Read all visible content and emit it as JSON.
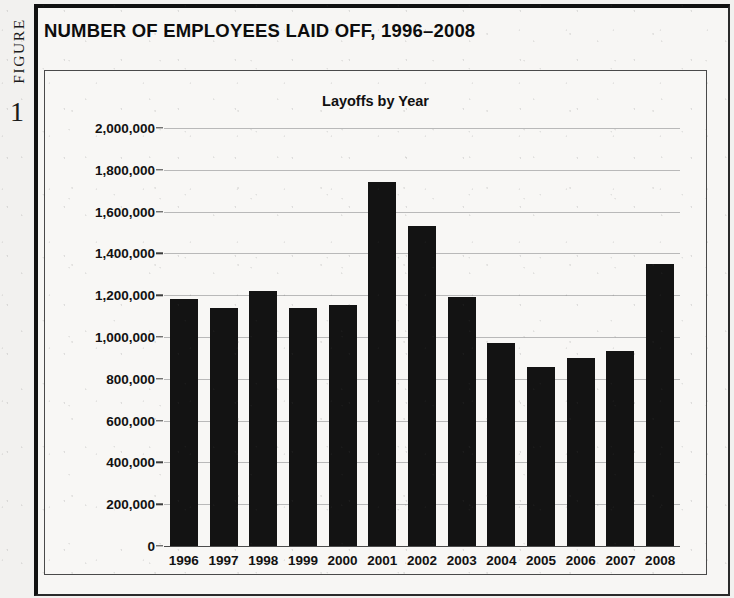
{
  "figure": {
    "label_word": "FIGURE",
    "label_number": "1",
    "title": "NUMBER OF EMPLOYEES LAID OFF, 1996–2008"
  },
  "chart_data": {
    "type": "bar",
    "title": "Layoffs by Year",
    "xlabel": "",
    "ylabel": "",
    "categories": [
      "1996",
      "1997",
      "1998",
      "1999",
      "2000",
      "2001",
      "2002",
      "2003",
      "2004",
      "2005",
      "2006",
      "2007",
      "2008"
    ],
    "values": [
      1180000,
      1140000,
      1220000,
      1140000,
      1155000,
      1740000,
      1530000,
      1190000,
      970000,
      855000,
      900000,
      935000,
      1350000
    ],
    "ylim": [
      0,
      2000000
    ],
    "ytick_values": [
      0,
      200000,
      400000,
      600000,
      800000,
      1000000,
      1200000,
      1400000,
      1600000,
      1800000,
      2000000
    ],
    "ytick_labels": [
      "0",
      "200,000",
      "400,000",
      "600,000",
      "800,000",
      "1,000,000",
      "1,200,000",
      "1,400,000",
      "1,600,000",
      "1,800,000",
      "2,000,000"
    ],
    "grid": true,
    "legend": false,
    "bar_color": "#131313",
    "grid_color": "#b9b9b9",
    "axis_color": "#4c4c4c"
  }
}
